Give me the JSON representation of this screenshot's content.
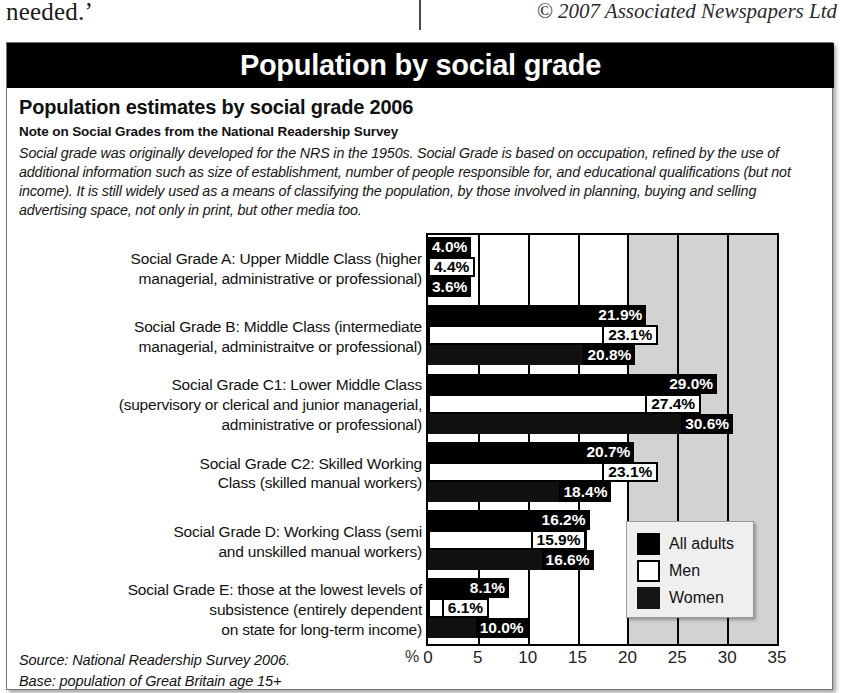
{
  "newspaper": {
    "left_text": "needed.’",
    "copyright": "© 2007 Associated Newspapers Ltd"
  },
  "panel": {
    "title": "Population by social grade",
    "heading": "Population estimates by social grade 2006",
    "note_heading": "Note on Social Grades from the National Readership Survey",
    "note_body": "Social grade was originally developed for the NRS in the 1950s. Social Grade is based on occupation, refined by the use of additional information such as size of establishment, number of people responsible for, and educational qualifications (but not income). It is still widely used as a means of classifying the population, by those involved in planning, buying and selling advertising space, not only in print, but other media too.",
    "source_line_1": "Source: National Readership Survey 2006.",
    "source_line_2": "Base: population of Great Britain age 15+"
  },
  "legend": {
    "items": [
      {
        "label": "All adults",
        "color": "#000000"
      },
      {
        "label": "Men",
        "color": "#ffffff"
      },
      {
        "label": "Women",
        "color": "#151515"
      }
    ]
  },
  "axis": {
    "unit_symbol": "%",
    "ticks": [
      "0",
      "5",
      "10",
      "15",
      "20",
      "25",
      "30",
      "35"
    ]
  },
  "chart_data": {
    "type": "bar",
    "orientation": "horizontal",
    "title": "Population estimates by social grade 2006",
    "xlabel": "%",
    "ylabel": "",
    "xlim": [
      0,
      35
    ],
    "xticks": [
      0,
      5,
      10,
      15,
      20,
      25,
      30,
      35
    ],
    "grid": true,
    "legend_position": "inside-right",
    "categories": [
      "Social Grade A: Upper Middle Class (higher managerial, administrative or professional)",
      "Social Grade B: Middle Class (intermediate managerial, administraitve or professional)",
      "Social Grade C1: Lower Middle Class (supervisory or clerical and junior managerial, administrative or professional)",
      "Social Grade C2: Skilled Working Class (skilled manual workers)",
      "Social Grade D: Working Class (semi and unskilled manual workers)",
      "Social Grade E: those at the lowest levels of subsistence (entirely dependent on state for long-term income)"
    ],
    "category_lines": [
      [
        "Social Grade A: Upper Middle Class (higher",
        "managerial, administrative or professional)"
      ],
      [
        "Social Grade B: Middle Class (intermediate",
        "managerial, administraitve or professional)"
      ],
      [
        "Social Grade C1: Lower Middle Class",
        "(supervisory or clerical and junior managerial,",
        "administrative or professional)"
      ],
      [
        "Social Grade C2: Skilled Working",
        "Class (skilled manual workers)"
      ],
      [
        "Social Grade D: Working Class (semi",
        "and unskilled manual workers)"
      ],
      [
        "Social Grade E: those at the lowest levels of",
        "subsistence (entirely dependent",
        "on state for long-term income)"
      ]
    ],
    "series": [
      {
        "name": "All adults",
        "color": "#000000",
        "values": [
          4.0,
          21.9,
          29.0,
          20.7,
          16.2,
          8.1
        ],
        "labels": [
          "4.0%",
          "21.9%",
          "29.0%",
          "20.7%",
          "16.2%",
          "8.1%"
        ]
      },
      {
        "name": "Men",
        "color": "#ffffff",
        "values": [
          4.4,
          23.1,
          27.4,
          23.1,
          15.9,
          6.1
        ],
        "labels": [
          "4.4%",
          "23.1%",
          "27.4%",
          "23.1%",
          "15.9%",
          "6.1%"
        ]
      },
      {
        "name": "Women",
        "color": "#151515",
        "values": [
          3.6,
          20.8,
          30.6,
          18.4,
          16.6,
          10.0
        ],
        "labels": [
          "3.6%",
          "20.8%",
          "30.6%",
          "18.4%",
          "16.6%",
          "10.0%"
        ]
      }
    ]
  }
}
